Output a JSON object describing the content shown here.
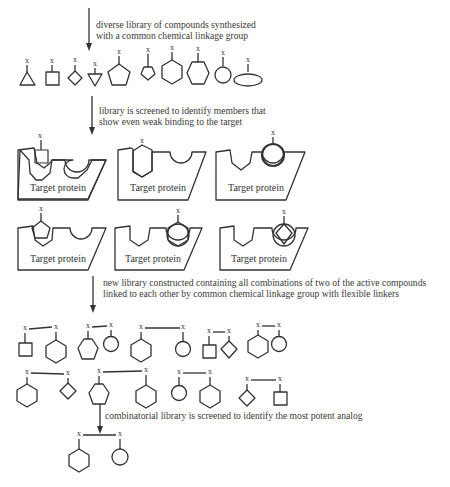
{
  "diagram": {
    "steps": [
      {
        "caption_line1": "diverse library of compounds synthesized",
        "caption_line2": "with a common chemical linkage group"
      },
      {
        "caption_line1": "library is screened to identify members that",
        "caption_line2": "show even weak binding to the target"
      },
      {
        "caption_line1": "new library constructed containing all combinations of two of the active compounds",
        "caption_line2": "linked to each other by common chemical linkage group with flexible linkers"
      },
      {
        "caption_line1": "combinatorial library is screened to identify the most potent analog"
      }
    ],
    "linker_label": "x",
    "protein_label": "Target protein",
    "initial_library": [
      "triangle",
      "square",
      "diamond",
      "inverted-triangle",
      "pentagon",
      "small-pentagon",
      "hexagon",
      "flat-hexagon",
      "circle",
      "ellipse"
    ],
    "binding_results": [
      {
        "fragment": "square",
        "bound": true
      },
      {
        "fragment": "hexagon",
        "bound": true
      },
      {
        "fragment": "circle",
        "bound": true
      },
      {
        "fragment": "pentagon",
        "bound": true
      },
      {
        "fragment": "hexagon",
        "bound": true
      },
      {
        "fragment": "diamond",
        "bound": true
      }
    ],
    "combination_library": [
      [
        "square",
        "hexagon"
      ],
      [
        "pentagon",
        "circle"
      ],
      [
        "hexagon",
        "circle"
      ],
      [
        "square",
        "diamond"
      ],
      [
        "hexagon",
        "circle"
      ],
      [
        "hexagon",
        "diamond"
      ],
      [
        "pentagon",
        "hexagon"
      ],
      [
        "circle",
        "hexagon"
      ],
      [
        "diamond",
        "square"
      ]
    ],
    "most_potent_analog": [
      "hexagon",
      "circle"
    ],
    "footer_faint": "—"
  }
}
